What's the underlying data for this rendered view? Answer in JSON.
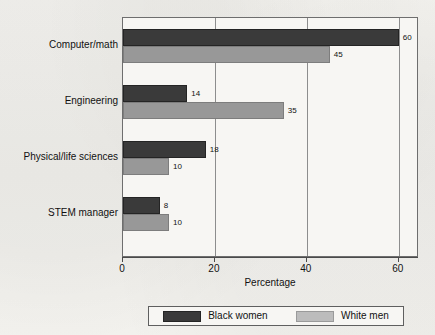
{
  "chart_data": {
    "type": "bar",
    "orientation": "horizontal",
    "title": "",
    "xlabel": "Percentage",
    "ylabel": "",
    "xlim": [
      0,
      64.4
    ],
    "xticks": [
      0,
      20,
      40,
      60
    ],
    "xticklabels": [
      "0",
      "20",
      "40",
      "60"
    ],
    "grid": true,
    "grid_axis": "x",
    "legend_position": "bottom",
    "categories": [
      "Computer/math",
      "Engineering",
      "Physical/life sciences",
      "STEM manager"
    ],
    "series": [
      {
        "name": "Black women",
        "color": "#3a3a3a",
        "values": [
          60,
          14,
          18,
          8
        ],
        "labels": [
          "60",
          "14",
          "18",
          "8"
        ]
      },
      {
        "name": "White men",
        "color": "#989898",
        "values": [
          45,
          35,
          10,
          10
        ],
        "labels": [
          "45",
          "35",
          "10",
          "10"
        ]
      }
    ]
  },
  "axis": {
    "x_title": "Percentage"
  },
  "legend": {
    "entries": [
      {
        "label": "Black women",
        "swatch": "dark-swatch-icon"
      },
      {
        "label": "White men",
        "swatch": "light-swatch-icon"
      }
    ]
  }
}
